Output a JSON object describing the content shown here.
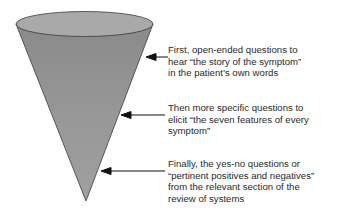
{
  "diagram": {
    "shape": "inverted-cone-funnel",
    "colors": {
      "cone_fill": "#8f8f8f",
      "cone_top": "#a8a8a8",
      "outline": "#3a3a3a",
      "arrow": "#111111",
      "text": "#2a2a2a"
    },
    "annotations": [
      {
        "lines": [
          "First, open-ended questions to",
          "hear “the story of the symptom”",
          "in the patient’s own words"
        ]
      },
      {
        "lines": [
          "Then more specific questions to",
          "elicit “the seven features of every",
          "symptom”"
        ]
      },
      {
        "lines": [
          "Finally, the yes-no questions or",
          "“pertinent positives and negatives”",
          "from the relevant section of the",
          "review of systems"
        ]
      }
    ]
  }
}
